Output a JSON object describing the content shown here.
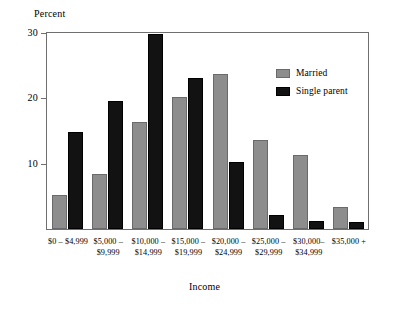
{
  "chart_data": {
    "type": "bar",
    "title": "",
    "xlabel": "Income",
    "ylabel": "Percent",
    "ylim": [
      0,
      30
    ],
    "yticks": [
      0,
      10,
      20,
      30
    ],
    "ytick_labels": [
      "0",
      "10",
      "20",
      "30"
    ],
    "grid": false,
    "legend_position": "top-right",
    "categories": [
      "$0 – $4,999",
      "$5,000 –\n$9,999",
      "$10,000 –\n$14,999",
      "$15,000 –\n$19,999",
      "$20,000 –\n$24,999",
      "$25,000 –\n$29,999",
      "$30,000–\n$34,999",
      "$35,000 +"
    ],
    "series": [
      {
        "name": "Married",
        "color": "#8d8d8d",
        "values": [
          5.2,
          8.4,
          16.4,
          20.2,
          23.8,
          13.6,
          11.3,
          3.4
        ]
      },
      {
        "name": "Single parent",
        "color": "#121212",
        "values": [
          14.9,
          19.6,
          29.8,
          23.1,
          10.3,
          2.2,
          1.2,
          1.0
        ]
      }
    ]
  },
  "axes": {
    "y_title": "Percent",
    "x_title": "Income",
    "y_labels": [
      "30",
      "20",
      "10"
    ]
  },
  "legend": {
    "items": [
      {
        "label": "Married",
        "swatch": "gray-swatch"
      },
      {
        "label": "Single parent",
        "swatch": "black-swatch"
      }
    ]
  }
}
